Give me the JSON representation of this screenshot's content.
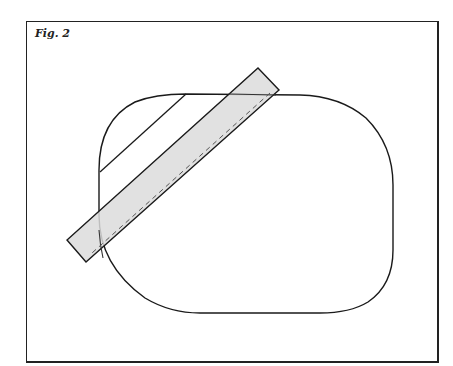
{
  "figure": {
    "label": "Fig. 2"
  },
  "colors": {
    "stroke": "#1a1a1a",
    "strip_fill": "#e2e2e2",
    "background": "#ffffff"
  },
  "shapes": {
    "rounded_outline": {
      "left": 99,
      "top": 94,
      "right": 393,
      "bottom": 313
    },
    "strip_corners": [
      [
        258,
        68
      ],
      [
        279,
        90
      ],
      [
        86,
        262
      ],
      [
        67,
        240
      ]
    ],
    "inner_line": [
      [
        186,
        94
      ],
      [
        100,
        172
      ]
    ],
    "dashed_line": [
      [
        270,
        93
      ],
      [
        92,
        253
      ]
    ]
  }
}
